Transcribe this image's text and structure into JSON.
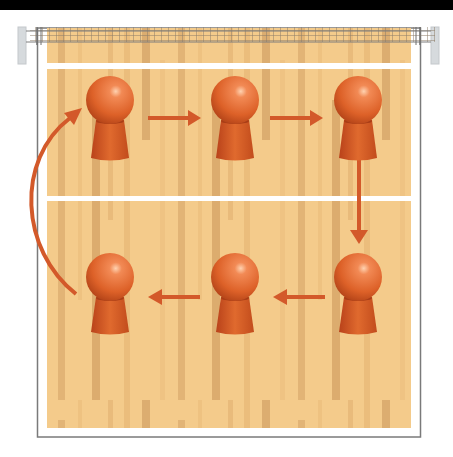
{
  "diagram": {
    "type": "volleyball-rotation",
    "colors": {
      "floor": "#f3c989",
      "floor_dark": "#deaf72",
      "line": "#ffffff",
      "border": "#7a7a7a",
      "player": "#e0672f",
      "player_dark": "#c24a18",
      "arrow": "#d3592a",
      "net": "#8a7a66",
      "post": "#d8dcdf"
    },
    "players": [
      {
        "id": 1,
        "x": 110,
        "y": 100
      },
      {
        "id": 2,
        "x": 235,
        "y": 100
      },
      {
        "id": 3,
        "x": 358,
        "y": 100
      },
      {
        "id": 4,
        "x": 358,
        "y": 277
      },
      {
        "id": 5,
        "x": 235,
        "y": 277
      },
      {
        "id": 6,
        "x": 110,
        "y": 277
      }
    ],
    "arrows": [
      {
        "from": 1,
        "to": 2,
        "direction": "right"
      },
      {
        "from": 2,
        "to": 3,
        "direction": "right"
      },
      {
        "from": 3,
        "to": 4,
        "direction": "down"
      },
      {
        "from": 4,
        "to": 5,
        "direction": "left"
      },
      {
        "from": 5,
        "to": 6,
        "direction": "left"
      },
      {
        "from": 6,
        "to": 1,
        "direction": "curved-up"
      }
    ]
  }
}
